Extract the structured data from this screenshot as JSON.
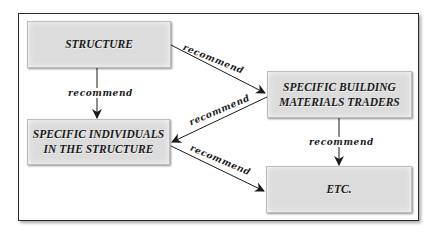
{
  "diagram": {
    "type": "flowchart",
    "nodes": [
      {
        "id": "structure",
        "label": "STRUCTURE"
      },
      {
        "id": "traders",
        "label": "SPECIFIC BUILDING\nMATERIALS TRADERS"
      },
      {
        "id": "individuals",
        "label": "SPECIFIC INDIVIDUALS\nIN THE STRUCTURE"
      },
      {
        "id": "etc",
        "label": "ETC."
      }
    ],
    "edges": [
      {
        "from": "structure",
        "to": "traders",
        "label": "recommend"
      },
      {
        "from": "structure",
        "to": "individuals",
        "label": "recommend"
      },
      {
        "from": "traders",
        "to": "individuals",
        "label": "recommend"
      },
      {
        "from": "traders",
        "to": "etc",
        "label": "recommend"
      },
      {
        "from": "individuals",
        "to": "etc",
        "label": "recommend"
      }
    ],
    "colors": {
      "node_fill": "#dcdcdc",
      "node_text": "#1a1a1a",
      "edge": "#1a1a1a",
      "frame": "#2a2a2a",
      "background": "#ffffff"
    }
  }
}
